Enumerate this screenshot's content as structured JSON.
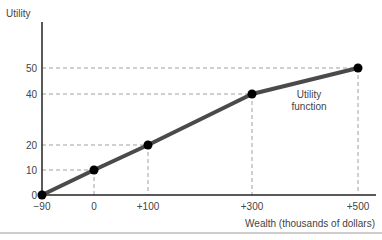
{
  "chart_data": {
    "type": "line",
    "title": "",
    "xlabel": "Wealth (thousands of dollars)",
    "ylabel": "Utility",
    "annotation": [
      "Utility",
      "function"
    ],
    "x_ticks": [
      "−90",
      "0",
      "+100",
      "+300",
      "+500"
    ],
    "y_ticks": [
      "0",
      "10",
      "20",
      "40",
      "50"
    ],
    "series": [
      {
        "name": "Utility function",
        "x": [
          -90,
          0,
          100,
          300,
          500
        ],
        "y": [
          0,
          10,
          20,
          40,
          50
        ]
      }
    ],
    "xlim": [
      -90,
      520
    ],
    "ylim": [
      0,
      68
    ],
    "grid": false,
    "dashed_guides": true,
    "colors": {
      "line": "#4a4a4a",
      "point": "#000000",
      "axis": "#222222",
      "guide": "#888888"
    }
  }
}
